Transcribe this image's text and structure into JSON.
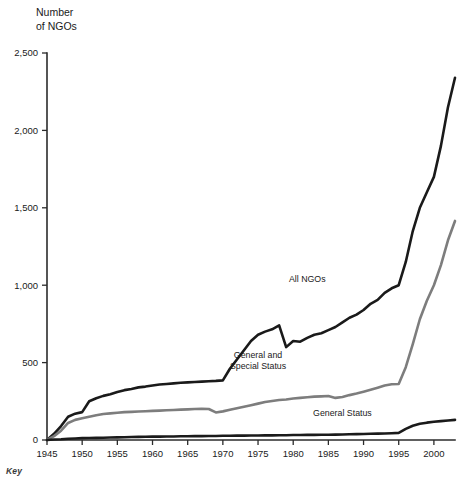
{
  "chart_data": {
    "type": "line",
    "title": "",
    "ylabel_line1": "Number",
    "ylabel_line2": "of NGOs",
    "xlabel": "",
    "xlim": [
      1945,
      2003
    ],
    "ylim": [
      0,
      2500
    ],
    "grid": false,
    "legend_position": "inline-annotations",
    "x_ticks": [
      "1945",
      "1950",
      "1955",
      "1960",
      "1965",
      "1970",
      "1975",
      "1980",
      "1985",
      "1990",
      "1995",
      "2000"
    ],
    "x_tick_values": [
      1945,
      1950,
      1955,
      1960,
      1965,
      1970,
      1975,
      1980,
      1985,
      1990,
      1995,
      2000
    ],
    "y_ticks": [
      "0",
      "500",
      "1,000",
      "1,500",
      "2,000",
      "2,500"
    ],
    "y_tick_values": [
      0,
      500,
      1000,
      1500,
      2000,
      2500
    ],
    "x": [
      1945,
      1946,
      1947,
      1948,
      1949,
      1950,
      1951,
      1952,
      1953,
      1954,
      1955,
      1956,
      1957,
      1958,
      1959,
      1960,
      1961,
      1962,
      1963,
      1964,
      1965,
      1966,
      1967,
      1968,
      1969,
      1970,
      1971,
      1972,
      1973,
      1974,
      1975,
      1976,
      1977,
      1978,
      1979,
      1980,
      1981,
      1982,
      1983,
      1984,
      1985,
      1986,
      1987,
      1988,
      1989,
      1990,
      1991,
      1992,
      1993,
      1994,
      1995,
      1996,
      1997,
      1998,
      1999,
      2000,
      2001,
      2002,
      2003
    ],
    "series": [
      {
        "name": "All NGOs",
        "color": "#1a1a1a",
        "width": 2.6,
        "label_x": 1982,
        "label_y": 1020,
        "values": [
          0,
          40,
          90,
          150,
          170,
          180,
          250,
          270,
          285,
          295,
          310,
          322,
          330,
          340,
          345,
          352,
          358,
          362,
          366,
          370,
          372,
          375,
          377,
          380,
          382,
          385,
          460,
          520,
          580,
          640,
          680,
          700,
          715,
          740,
          600,
          640,
          635,
          660,
          680,
          690,
          710,
          730,
          760,
          790,
          810,
          840,
          880,
          905,
          950,
          980,
          1000,
          1150,
          1350,
          1500,
          1600,
          1700,
          1900,
          2150,
          2340
        ]
      },
      {
        "name": "General and Special Status",
        "color": "#7d7d7d",
        "width": 2.6,
        "label_x": 1975,
        "label_y": 530,
        "label_line1": "General and",
        "label_line2": "Special Status",
        "values": [
          0,
          25,
          60,
          110,
          130,
          140,
          150,
          160,
          168,
          172,
          176,
          180,
          182,
          184,
          186,
          188,
          190,
          192,
          194,
          196,
          198,
          200,
          202,
          200,
          178,
          185,
          195,
          205,
          215,
          225,
          235,
          245,
          252,
          258,
          262,
          268,
          272,
          276,
          280,
          282,
          284,
          272,
          278,
          290,
          300,
          312,
          325,
          338,
          352,
          360,
          362,
          470,
          620,
          780,
          900,
          1000,
          1130,
          1290,
          1415
        ]
      },
      {
        "name": "General Status",
        "color": "#1a1a1a",
        "width": 2.6,
        "label_x": 1987,
        "label_y": 155,
        "values": [
          0,
          3,
          5,
          8,
          10,
          12,
          13,
          14,
          15,
          16,
          17,
          18,
          19,
          20,
          21,
          22,
          22,
          23,
          23,
          24,
          24,
          25,
          25,
          26,
          26,
          27,
          27,
          28,
          28,
          29,
          29,
          30,
          30,
          31,
          31,
          32,
          32,
          33,
          33,
          34,
          34,
          35,
          36,
          37,
          38,
          39,
          40,
          41,
          42,
          44,
          46,
          72,
          92,
          105,
          112,
          118,
          122,
          126,
          130
        ]
      }
    ]
  },
  "footer": {
    "key_label": "Key"
  }
}
